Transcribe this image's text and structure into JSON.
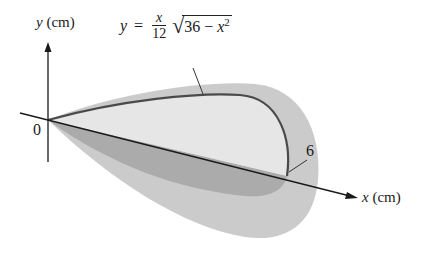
{
  "figure": {
    "y_axis_label": {
      "var": "y",
      "unit": "(cm)"
    },
    "x_axis_label": {
      "var": "x",
      "unit": "(cm)"
    },
    "origin_label": "0",
    "curve_end_label": "6",
    "equation": {
      "lhs": "y",
      "equals": "=",
      "frac_num": "x",
      "frac_den": "12",
      "radicand_const": "36",
      "radicand_op": "−",
      "radicand_var": "x",
      "radicand_exp": "2"
    },
    "colors": {
      "outer_surface": "#c9c9c9",
      "upper_face": "#e4e4e4",
      "lower_face": "#a9a9a9",
      "curve": "#4a4a4a",
      "axis": "#1a1a1a"
    }
  }
}
